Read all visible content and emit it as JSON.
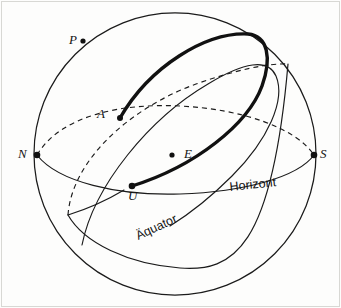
{
  "figure": {
    "kind": "celestial-sphere-diagram",
    "width": 341,
    "height": 308,
    "background_color": "#fdfdfc",
    "ink_color": "#1b1b1b"
  },
  "points": [
    {
      "id": "P",
      "label": "P",
      "x": 83,
      "y": 41,
      "meaning": "celestial-pole"
    },
    {
      "id": "A",
      "label": "A",
      "x": 120,
      "y": 118,
      "meaning": "sunrise-point"
    },
    {
      "id": "N",
      "label": "N",
      "x": 37,
      "y": 155,
      "meaning": "north-point"
    },
    {
      "id": "S",
      "label": "S",
      "x": 314,
      "y": 155,
      "meaning": "south-point"
    },
    {
      "id": "E",
      "label": "E",
      "x": 172,
      "y": 155,
      "meaning": "observer-center"
    },
    {
      "id": "U",
      "label": "U",
      "x": 132,
      "y": 186,
      "meaning": "sunset-point"
    }
  ],
  "curve_labels": [
    {
      "id": "horizont",
      "text": "Horizont",
      "x": 229,
      "y": 181,
      "rotation_deg": -6
    },
    {
      "id": "aequator",
      "text": "Äquator",
      "x": 134,
      "y": 231,
      "rotation_deg": -25
    }
  ],
  "sphere": {
    "center_x": 175,
    "center_y": 154,
    "radius": 141
  },
  "curves": {
    "horizon": {
      "name": "Horizont",
      "style_front": "solid",
      "style_back": "dashed",
      "endpoint_left": "N",
      "endpoint_right": "S"
    },
    "equator": {
      "name": "Äquator",
      "style_front": "solid",
      "style_back": "dashed"
    },
    "sun_path": {
      "name": "Tagbogen",
      "style": "bold-solid",
      "rises_at": "A",
      "sets_at": "U"
    }
  }
}
